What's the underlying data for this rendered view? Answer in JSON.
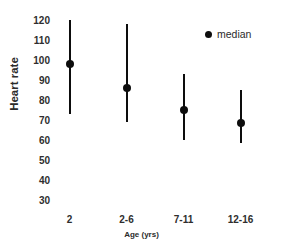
{
  "chart_data": {
    "type": "scatter",
    "title": "",
    "xlabel": "Age (yrs)",
    "ylabel": "Heart rate",
    "categories": [
      "2",
      "2-6",
      "7-11",
      "12-16"
    ],
    "ylim": [
      30,
      120
    ],
    "yticks": [
      120,
      110,
      100,
      90,
      80,
      70,
      60,
      50,
      40,
      30
    ],
    "grid": false,
    "legend": {
      "position": "top-right",
      "entries": [
        {
          "label": "median",
          "marker": "filled-circle",
          "color": "#0d0d0d"
        }
      ]
    },
    "series": [
      {
        "name": "median",
        "marker_color": "#0d0d0d",
        "line_color": "#0d0d0d",
        "points": [
          {
            "category": "2",
            "median": 98,
            "low": 73,
            "high": 120
          },
          {
            "category": "2-6",
            "median": 86,
            "low": 69,
            "high": 118
          },
          {
            "category": "7-11",
            "median": 75,
            "low": 60,
            "high": 93
          },
          {
            "category": "12-16",
            "median": 68.5,
            "low": 58.5,
            "high": 85
          }
        ]
      }
    ]
  }
}
